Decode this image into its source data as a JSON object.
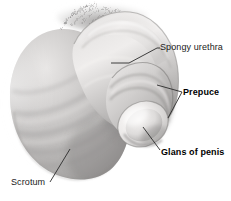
{
  "figure": {
    "background_color": "#ffffff",
    "width": 231,
    "height": 201,
    "style": "grayscale medical illustration"
  },
  "labels": [
    {
      "id": "spongy-urethra",
      "text": "Spongy urethra",
      "weight": "regular",
      "color": "#1a1a1a",
      "leader": "from shaft mid-line to label left"
    },
    {
      "id": "prepuce",
      "text": "Prepuce",
      "weight": "bold",
      "color": "#000000",
      "leader": "two-branch V pointing to foreskin fold"
    },
    {
      "id": "glans-of-penis",
      "text": "Glans of penis",
      "weight": "bold",
      "color": "#000000",
      "leader": "from glans tip down-right to label"
    },
    {
      "id": "scrotum",
      "text": "Scrotum",
      "weight": "regular",
      "color": "#1a1a1a",
      "leader": "from scrotal sac down-left to label"
    }
  ],
  "structures": [
    {
      "id": "scrotum-mass",
      "name": "Scrotum",
      "tone": "#b9b9b9"
    },
    {
      "id": "penile-shaft",
      "name": "Penile shaft",
      "tone": "#d4d4d4"
    },
    {
      "id": "urethra-ridge",
      "name": "Spongy urethra",
      "tone": "#e4e4e4"
    },
    {
      "id": "prepuce-fold",
      "name": "Prepuce",
      "tone": "#c6c6c6"
    },
    {
      "id": "glans-tip",
      "name": "Glans of penis",
      "tone": "#efeceb"
    },
    {
      "id": "pubic-hair",
      "name": "Pubic hair",
      "tone": "#8f8f8f"
    }
  ],
  "colors": {
    "background": "#ffffff",
    "leader_line": "#2b2b2b",
    "label_regular": "#1a1a1a",
    "label_bold": "#000000",
    "shadow": "#9a9a9a",
    "highlight": "#f2f0ef"
  }
}
